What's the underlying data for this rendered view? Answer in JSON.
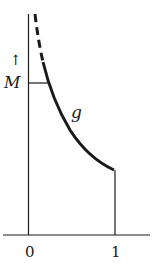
{
  "figure": {
    "y_axis_arrow": "↑",
    "y_axis_label": "M",
    "curve_label": "g",
    "x_ticks": [
      {
        "label": "0",
        "value": 0
      },
      {
        "label": "1",
        "value": 1
      }
    ],
    "colors": {
      "ink": "#1a1a1a",
      "background": "#ffffff"
    },
    "curve": {
      "description": "Decreasing function g on (0,1], unbounded near 0 (dashed), bounded by M at a point, ends at x=1 with vertical drop to axis",
      "dashed_portion": "near x→0, above level M",
      "solid_portion": "from level M down to x=1"
    }
  }
}
